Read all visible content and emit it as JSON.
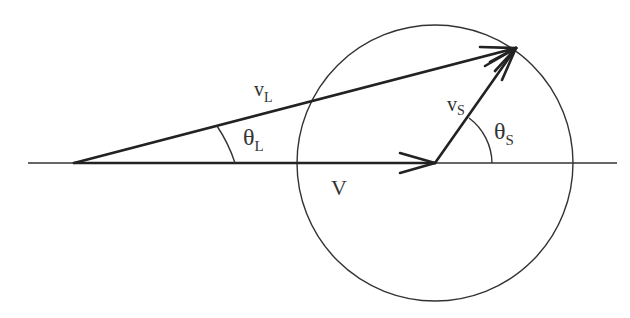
{
  "diagram": {
    "labels": {
      "v_lab": "v",
      "v_lab_sub": "L",
      "theta_lab": "θ",
      "theta_lab_sub": "L",
      "v_source": "v",
      "v_source_sub": "S",
      "theta_source": "θ",
      "theta_source_sub": "S",
      "v_frame": "V"
    },
    "geometry": {
      "axis": {
        "x1": 28,
        "x2": 617,
        "y": 163
      },
      "origin": {
        "x": 74,
        "y": 163
      },
      "v_frame_end": {
        "x": 435,
        "y": 163
      },
      "tip": {
        "x": 516,
        "y": 48
      },
      "circle": {
        "cx": 435,
        "cy": 163,
        "r": 138
      }
    },
    "colors": {
      "stroke": "#222222",
      "background": "#ffffff"
    }
  }
}
